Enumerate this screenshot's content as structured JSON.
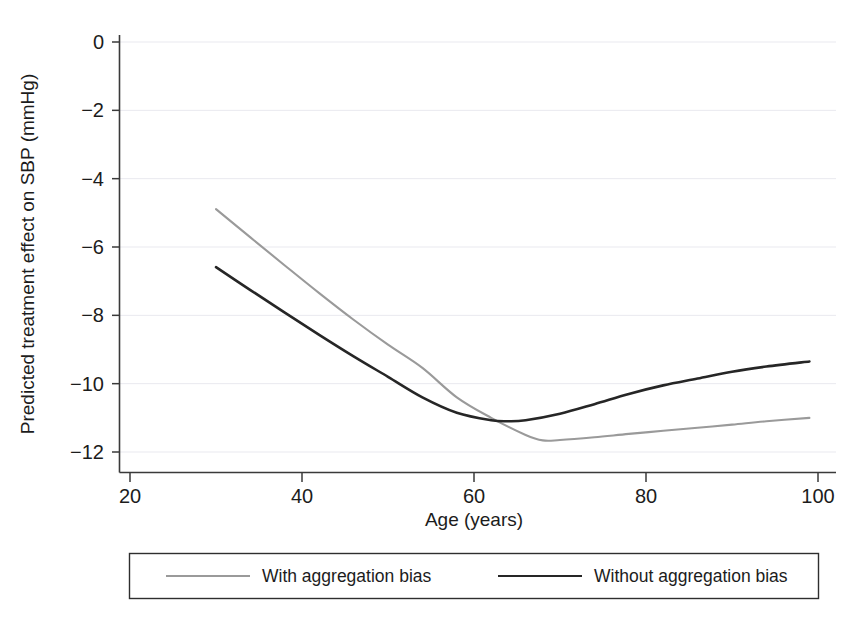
{
  "chart_data": {
    "type": "line",
    "title": "",
    "subtitle": "",
    "xlabel": "Age (years)",
    "ylabel": "Predicted treatment effect on SBP (mmHg)",
    "xlim": [
      17,
      101.5
    ],
    "ylim": [
      -12.6,
      0.6
    ],
    "xticks": [
      20,
      40,
      60,
      80,
      100
    ],
    "xtick_labels": [
      "20",
      "40",
      "60",
      "80",
      "100"
    ],
    "yticks": [
      0,
      -2,
      -4,
      -6,
      -8,
      -10,
      -12
    ],
    "ytick_labels": [
      "0",
      "−2",
      "−4",
      "−6",
      "−8",
      "−10",
      "−12"
    ],
    "grid": "horizontal-faint",
    "legend_position": "below-plot",
    "series": [
      {
        "name": "With aggregation bias",
        "color": "#9a9a9a",
        "width": 2.1,
        "x": [
          30,
          34,
          38,
          42,
          46,
          50,
          54,
          58,
          62,
          66,
          68,
          70,
          74,
          78,
          82,
          86,
          90,
          94,
          99
        ],
        "values": [
          -4.89,
          -5.72,
          -6.54,
          -7.35,
          -8.13,
          -8.86,
          -9.54,
          -10.4,
          -11.0,
          -11.5,
          -11.66,
          -11.65,
          -11.57,
          -11.47,
          -11.38,
          -11.29,
          -11.2,
          -11.1,
          -11.0
        ]
      },
      {
        "name": "Without aggregation bias",
        "color": "#262626",
        "width": 2.6,
        "x": [
          30,
          34,
          38,
          42,
          46,
          50,
          54,
          58,
          62,
          64,
          66,
          70,
          74,
          78,
          82,
          86,
          90,
          94,
          99
        ],
        "values": [
          -6.59,
          -7.26,
          -7.92,
          -8.57,
          -9.2,
          -9.8,
          -10.4,
          -10.85,
          -11.07,
          -11.1,
          -11.07,
          -10.88,
          -10.6,
          -10.3,
          -10.05,
          -9.85,
          -9.65,
          -9.5,
          -9.35
        ]
      }
    ],
    "annotations": []
  },
  "legend": {
    "entries": [
      {
        "label": "With aggregation bias",
        "color": "#9a9a9a"
      },
      {
        "label": "Without aggregation bias",
        "color": "#262626"
      }
    ]
  }
}
